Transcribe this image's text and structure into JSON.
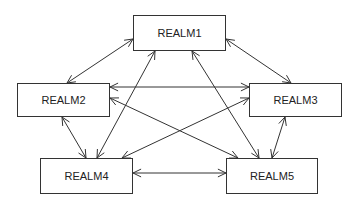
{
  "diagram": {
    "type": "network",
    "directed": "bidirectional",
    "nodes": [
      {
        "id": "r1",
        "label": "REALM1",
        "x": 133,
        "y": 15,
        "w": 93,
        "h": 36
      },
      {
        "id": "r2",
        "label": "REALM2",
        "x": 17,
        "y": 83,
        "w": 93,
        "h": 34
      },
      {
        "id": "r3",
        "label": "REALM3",
        "x": 249,
        "y": 83,
        "w": 93,
        "h": 34
      },
      {
        "id": "r4",
        "label": "REALM4",
        "x": 40,
        "y": 158,
        "w": 93,
        "h": 36
      },
      {
        "id": "r5",
        "label": "REALM5",
        "x": 226,
        "y": 158,
        "w": 92,
        "h": 36
      }
    ],
    "edges": [
      {
        "from": "REALM1",
        "to": "REALM2",
        "x1": 133,
        "y1": 39,
        "x2": 67,
        "y2": 83
      },
      {
        "from": "REALM1",
        "to": "REALM3",
        "x1": 226,
        "y1": 39,
        "x2": 291,
        "y2": 83
      },
      {
        "from": "REALM1",
        "to": "REALM4",
        "x1": 155,
        "y1": 51,
        "x2": 97,
        "y2": 158
      },
      {
        "from": "REALM1",
        "to": "REALM5",
        "x1": 192,
        "y1": 51,
        "x2": 259,
        "y2": 158
      },
      {
        "from": "REALM2",
        "to": "REALM3",
        "x1": 110,
        "y1": 87,
        "x2": 249,
        "y2": 87
      },
      {
        "from": "REALM2",
        "to": "REALM5",
        "x1": 110,
        "y1": 98,
        "x2": 238,
        "y2": 158
      },
      {
        "from": "REALM3",
        "to": "REALM4",
        "x1": 249,
        "y1": 98,
        "x2": 122,
        "y2": 158
      },
      {
        "from": "REALM2",
        "to": "REALM4",
        "x1": 62,
        "y1": 117,
        "x2": 86,
        "y2": 158
      },
      {
        "from": "REALM3",
        "to": "REALM5",
        "x1": 285,
        "y1": 117,
        "x2": 272,
        "y2": 158
      },
      {
        "from": "REALM4",
        "to": "REALM5",
        "x1": 133,
        "y1": 173,
        "x2": 226,
        "y2": 173
      }
    ]
  },
  "colors": {
    "stroke": "#333333",
    "background": "#ffffff",
    "text": "#222222"
  }
}
